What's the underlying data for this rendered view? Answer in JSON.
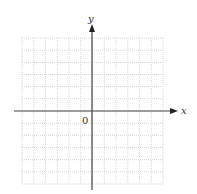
{
  "diagram": {
    "type": "coordinate-plane",
    "x_axis_label": "x",
    "y_axis_label": "y",
    "origin_label": "0",
    "grid": {
      "columns": 12,
      "rows": 12,
      "style": "dotted",
      "color": "#d8d8d8"
    },
    "axis_color": "#444444"
  }
}
